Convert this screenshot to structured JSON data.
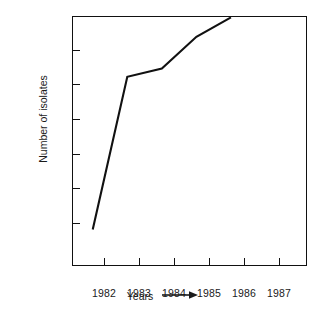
{
  "chart_data": {
    "type": "line",
    "title": "",
    "xlabel": "Years",
    "ylabel": "Number of isolates",
    "x": [
      1982,
      1983,
      1984,
      1985,
      1986
    ],
    "values": [
      4350,
      8750,
      8990,
      9900,
      10460
    ],
    "series": [
      {
        "name": "Number of isolates",
        "values": [
          4350,
          8750,
          8990,
          9900,
          10460
        ]
      }
    ],
    "xtick_labels": [
      "1982",
      "1983",
      "1984",
      "1985",
      "1986",
      "1987"
    ],
    "xtick_values": [
      1982,
      1983,
      1984,
      1985,
      1986,
      1987
    ],
    "ytick_labels": [
      "4500",
      "5500",
      "6500",
      "7500",
      "8500",
      "9500",
      "10,500"
    ],
    "ytick_values": [
      4500,
      5500,
      6500,
      7500,
      8500,
      9500,
      10500
    ],
    "xlim": [
      1981.4,
      1988.2
    ],
    "ylim": [
      3300,
      10500
    ],
    "grid": false,
    "legend": false,
    "legend_position": "none",
    "line_color": "#111111",
    "background_color": "#ffffff",
    "axis_color": "#111111"
  },
  "axes": {
    "x_title_text": "Years",
    "x_title_arrow": "arrow-right-icon",
    "y_title_text": "Number of isolates"
  }
}
